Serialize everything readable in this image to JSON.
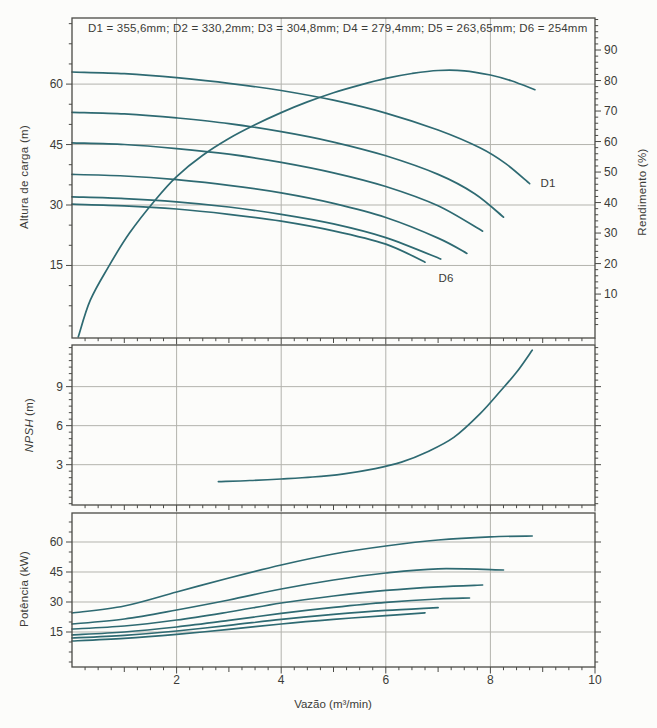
{
  "figure": {
    "legend": "D1 = 355,6mm; D2 = 330,2mm; D3 = 304,8mm; D4 = 279,4mm; D5 = 263,65mm; D6 = 254mm",
    "xlabel": "Vazão (m³/min)",
    "colors": {
      "curve": "#2e6a72",
      "grid": "#b3b3ad",
      "frame": "#4a4a46",
      "text": "#3b3b37",
      "paper": "#fcfcfa"
    }
  },
  "chart_data": [
    {
      "id": "head",
      "type": "line",
      "title": "",
      "ylabel": "Altura de carga (m)",
      "y2label": "Rendimento (%)",
      "xlabel": "Vazão (m³/min)",
      "xlim": [
        0,
        10
      ],
      "xticks": [
        2,
        4,
        6,
        8,
        10
      ],
      "xminor": 0.25,
      "ylim": [
        -3.0,
        76.4
      ],
      "yticks": [
        15,
        30,
        45,
        60
      ],
      "yminor": 5,
      "y2lim": [
        -4.4,
        100.5
      ],
      "y2ticks": [
        10,
        20,
        30,
        40,
        50,
        60,
        70,
        80,
        90
      ],
      "y2minor": 2,
      "grid_x": [
        2,
        4,
        6,
        8
      ],
      "grid_y": [
        15,
        30,
        45,
        60
      ],
      "annotations": [
        {
          "text": "D1",
          "x": 9.1,
          "y": 34.5
        },
        {
          "text": "D6",
          "x": 7.15,
          "y": 10.8
        }
      ],
      "series": [
        {
          "name": "D1",
          "points": [
            [
              0,
              63
            ],
            [
              1,
              62.6
            ],
            [
              2,
              61.6
            ],
            [
              3,
              60.2
            ],
            [
              4,
              58.4
            ],
            [
              5,
              56
            ],
            [
              6,
              52.8
            ],
            [
              7,
              48.6
            ],
            [
              7.8,
              44.2
            ],
            [
              8.3,
              40.2
            ],
            [
              8.75,
              35.3
            ]
          ]
        },
        {
          "name": "D2",
          "points": [
            [
              0,
              53
            ],
            [
              1,
              52.6
            ],
            [
              2,
              51.6
            ],
            [
              3,
              50.2
            ],
            [
              4,
              48.2
            ],
            [
              5,
              45.6
            ],
            [
              6,
              42.2
            ],
            [
              7,
              37.6
            ],
            [
              7.7,
              32.8
            ],
            [
              8.25,
              27
            ]
          ]
        },
        {
          "name": "D3",
          "points": [
            [
              0,
              45.4
            ],
            [
              1,
              45
            ],
            [
              2,
              44
            ],
            [
              3,
              42.6
            ],
            [
              4,
              40.6
            ],
            [
              5,
              38
            ],
            [
              6,
              34.6
            ],
            [
              7,
              29.8
            ],
            [
              7.85,
              23.5
            ]
          ]
        },
        {
          "name": "D4",
          "points": [
            [
              0,
              37.6
            ],
            [
              1,
              37.2
            ],
            [
              2,
              36.3
            ],
            [
              3,
              34.9
            ],
            [
              4,
              33
            ],
            [
              5,
              30.4
            ],
            [
              6,
              26.9
            ],
            [
              7,
              21.8
            ],
            [
              7.55,
              18
            ]
          ]
        },
        {
          "name": "D5",
          "points": [
            [
              0,
              32
            ],
            [
              1,
              31.6
            ],
            [
              2,
              30.8
            ],
            [
              3,
              29.5
            ],
            [
              4,
              27.7
            ],
            [
              5,
              25.3
            ],
            [
              6,
              21.9
            ],
            [
              7.05,
              16.6
            ]
          ]
        },
        {
          "name": "D6",
          "points": [
            [
              0,
              30.2
            ],
            [
              1,
              29.8
            ],
            [
              2,
              29
            ],
            [
              3,
              27.7
            ],
            [
              4,
              26
            ],
            [
              5,
              23.6
            ],
            [
              6,
              20.3
            ],
            [
              6.75,
              15.8
            ]
          ]
        },
        {
          "name": "Rendimento",
          "axis": "y2",
          "points": [
            [
              0.12,
              -4
            ],
            [
              0.35,
              8
            ],
            [
              0.7,
              19
            ],
            [
              1.1,
              30
            ],
            [
              1.6,
              41
            ],
            [
              2,
              48.5
            ],
            [
              2.5,
              55.5
            ],
            [
              3,
              61
            ],
            [
              3.5,
              65.5
            ],
            [
              4,
              69.5
            ],
            [
              4.5,
              73
            ],
            [
              5,
              76
            ],
            [
              5.5,
              78.5
            ],
            [
              6,
              80.7
            ],
            [
              6.5,
              82.3
            ],
            [
              7,
              83.3
            ],
            [
              7.5,
              83.2
            ],
            [
              8,
              81.8
            ],
            [
              8.4,
              79.9
            ],
            [
              8.85,
              77
            ]
          ]
        }
      ]
    },
    {
      "id": "npsh",
      "type": "line",
      "title": "",
      "ylabel": "NPSH (m)",
      "ylabel_italic": "NPSH",
      "ylabel_unit": "(m)",
      "xlim": [
        0,
        10
      ],
      "xticks": [
        2,
        4,
        6,
        8,
        10
      ],
      "xminor": 0.25,
      "ylim": [
        -0.1,
        12.2
      ],
      "yticks": [
        3,
        6,
        9
      ],
      "yminor": 0.5,
      "grid_x": [
        2,
        4,
        6,
        8
      ],
      "grid_y": [
        3,
        6,
        9
      ],
      "annotations": [],
      "series": [
        {
          "name": "NPSH",
          "points": [
            [
              2.8,
              1.7
            ],
            [
              3.4,
              1.78
            ],
            [
              4,
              1.9
            ],
            [
              4.6,
              2.05
            ],
            [
              5.2,
              2.3
            ],
            [
              5.8,
              2.7
            ],
            [
              6.3,
              3.2
            ],
            [
              6.8,
              4
            ],
            [
              7.3,
              5.1
            ],
            [
              7.8,
              6.9
            ],
            [
              8.2,
              8.7
            ],
            [
              8.5,
              10.1
            ],
            [
              8.8,
              11.8
            ]
          ]
        }
      ]
    },
    {
      "id": "power",
      "type": "line",
      "title": "",
      "ylabel": "Potência (kW)",
      "xlim": [
        0,
        10
      ],
      "xticks": [
        2,
        4,
        6,
        8,
        10
      ],
      "xminor": 0.25,
      "show_x_labels": true,
      "ylim": [
        -2.5,
        74.5
      ],
      "yticks": [
        15,
        30,
        45,
        60
      ],
      "yminor": 5,
      "grid_x": [
        2,
        4,
        6,
        8
      ],
      "grid_y": [
        15,
        30,
        45,
        60
      ],
      "annotations": [],
      "series": [
        {
          "name": "D1",
          "points": [
            [
              0,
              24.5
            ],
            [
              1,
              28
            ],
            [
              2,
              35
            ],
            [
              3,
              42
            ],
            [
              4,
              48.5
            ],
            [
              5,
              54
            ],
            [
              6,
              58
            ],
            [
              7,
              61
            ],
            [
              8,
              62.6
            ],
            [
              8.8,
              63
            ]
          ]
        },
        {
          "name": "D2",
          "points": [
            [
              0,
              19
            ],
            [
              1,
              21.5
            ],
            [
              2,
              26
            ],
            [
              3,
              31
            ],
            [
              4,
              36.5
            ],
            [
              5,
              41
            ],
            [
              6,
              44.5
            ],
            [
              7,
              46.6
            ],
            [
              8.25,
              46
            ]
          ]
        },
        {
          "name": "D3",
          "points": [
            [
              0,
              16.5
            ],
            [
              1,
              18
            ],
            [
              2,
              21
            ],
            [
              3,
              25
            ],
            [
              4,
              29.5
            ],
            [
              5,
              33
            ],
            [
              6,
              35.8
            ],
            [
              7,
              37.6
            ],
            [
              7.85,
              38.5
            ]
          ]
        },
        {
          "name": "D4",
          "points": [
            [
              0,
              13.5
            ],
            [
              1,
              15
            ],
            [
              2,
              17.5
            ],
            [
              3,
              20.8
            ],
            [
              4,
              24.3
            ],
            [
              5,
              27.3
            ],
            [
              6,
              29.8
            ],
            [
              7,
              31.5
            ],
            [
              7.6,
              32
            ]
          ]
        },
        {
          "name": "D5",
          "points": [
            [
              0,
              12
            ],
            [
              1,
              13.3
            ],
            [
              2,
              15.5
            ],
            [
              3,
              18.3
            ],
            [
              4,
              21.3
            ],
            [
              5,
              23.8
            ],
            [
              6,
              25.8
            ],
            [
              7,
              27.2
            ]
          ]
        },
        {
          "name": "D6",
          "points": [
            [
              0,
              10.5
            ],
            [
              1,
              11.8
            ],
            [
              2,
              13.8
            ],
            [
              3,
              16.3
            ],
            [
              4,
              19
            ],
            [
              5,
              21.3
            ],
            [
              6,
              23.2
            ],
            [
              6.75,
              24.6
            ]
          ]
        }
      ]
    }
  ]
}
